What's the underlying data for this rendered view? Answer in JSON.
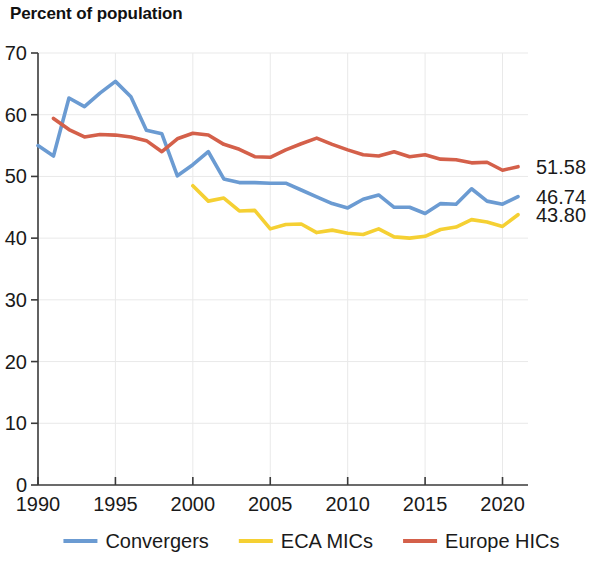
{
  "chart_data": {
    "type": "line",
    "title": "Percent of population",
    "xlabel": "",
    "ylabel": "",
    "xlim": [
      1990,
      2021
    ],
    "ylim": [
      0,
      70
    ],
    "ytick_labels": [
      "0",
      "10",
      "20",
      "30",
      "40",
      "50",
      "60",
      "70"
    ],
    "ytick_values": [
      0,
      10,
      20,
      30,
      40,
      50,
      60,
      70
    ],
    "xtick_labels": [
      "1990",
      "1995",
      "2000",
      "2005",
      "2010",
      "2015",
      "2020"
    ],
    "xtick_values": [
      1990,
      1995,
      2000,
      2005,
      2010,
      2015,
      2020
    ],
    "grid": true,
    "legend_position": "bottom",
    "series": [
      {
        "name": "Convergers",
        "color": "#6b9bd2",
        "end_label": "46.74",
        "x": [
          1990,
          1991,
          1992,
          1993,
          1994,
          1995,
          1996,
          1997,
          1998,
          1999,
          2000,
          2001,
          2002,
          2003,
          2004,
          2005,
          2006,
          2007,
          2008,
          2009,
          2010,
          2011,
          2012,
          2013,
          2014,
          2015,
          2016,
          2017,
          2018,
          2019,
          2020,
          2021
        ],
        "values": [
          55.0,
          53.3,
          62.7,
          61.3,
          63.5,
          65.4,
          62.9,
          57.5,
          56.9,
          50.1,
          51.9,
          54.0,
          49.6,
          49.0,
          49.0,
          48.9,
          48.9,
          47.8,
          46.7,
          45.6,
          44.9,
          46.3,
          47.0,
          45.0,
          45.0,
          44.0,
          45.6,
          45.5,
          48.0,
          46.0,
          45.5,
          46.74
        ]
      },
      {
        "name": "ECA MICs",
        "color": "#f5d033",
        "end_label": "43.80",
        "x": [
          2000,
          2001,
          2002,
          2003,
          2004,
          2005,
          2006,
          2007,
          2008,
          2009,
          2010,
          2011,
          2012,
          2013,
          2014,
          2015,
          2016,
          2017,
          2018,
          2019,
          2020,
          2021
        ],
        "values": [
          48.5,
          46.0,
          46.5,
          44.4,
          44.5,
          41.5,
          42.2,
          42.3,
          40.9,
          41.3,
          40.8,
          40.6,
          41.5,
          40.2,
          40.0,
          40.3,
          41.4,
          41.8,
          43.0,
          42.6,
          41.9,
          43.8
        ]
      },
      {
        "name": "Europe HICs",
        "color": "#d4604a",
        "end_label": "51.58",
        "x": [
          1991,
          1992,
          1993,
          1994,
          1995,
          1996,
          1997,
          1998,
          1999,
          2000,
          2001,
          2002,
          2003,
          2004,
          2005,
          2006,
          2007,
          2008,
          2009,
          2010,
          2011,
          2012,
          2013,
          2014,
          2015,
          2016,
          2017,
          2018,
          2019,
          2020,
          2021
        ],
        "values": [
          59.4,
          57.6,
          56.4,
          56.8,
          56.7,
          56.4,
          55.8,
          54.0,
          56.1,
          57.0,
          56.7,
          55.2,
          54.4,
          53.2,
          53.1,
          54.3,
          55.3,
          56.2,
          55.2,
          54.3,
          53.5,
          53.3,
          54.0,
          53.2,
          53.5,
          52.8,
          52.7,
          52.2,
          52.3,
          51.0,
          51.58
        ]
      }
    ]
  },
  "legend": {
    "items": [
      {
        "label": "Convergers",
        "color": "#6b9bd2"
      },
      {
        "label": "ECA MICs",
        "color": "#f5d033"
      },
      {
        "label": "Europe HICs",
        "color": "#d4604a"
      }
    ]
  }
}
